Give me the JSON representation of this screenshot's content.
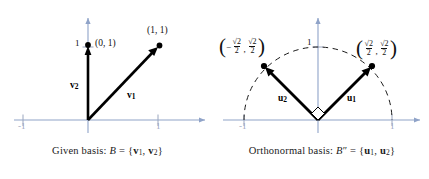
{
  "figure": {
    "type": "vector-diagram",
    "panels": [
      {
        "id": "left",
        "caption_prefix": "Given basis: ",
        "caption_symbol": "B",
        "caption_eq": " = ",
        "caption_set_open": "{",
        "caption_v1": "v",
        "caption_v1_sub": "1",
        "caption_comma": ", ",
        "caption_v2": "v",
        "caption_v2_sub": "2",
        "caption_set_close": "}",
        "point_labels": [
          "(0, 1)",
          "(1, 1)"
        ],
        "vector_labels": [
          {
            "name": "v",
            "sub": "2"
          },
          {
            "name": "v",
            "sub": "1"
          }
        ],
        "axis_ticks": {
          "x_neg": "-1",
          "x_pos": "1",
          "y_pos": "1"
        },
        "vectors": [
          {
            "label": "v1",
            "x": 1,
            "y": 1
          },
          {
            "label": "v2",
            "x": 0,
            "y": 1
          }
        ]
      },
      {
        "id": "right",
        "caption_prefix": "Orthonormal basis: ",
        "caption_symbol": "B",
        "caption_prime": "″",
        "caption_eq": " = ",
        "caption_set_open": "{",
        "caption_u1": "u",
        "caption_u1_sub": "1",
        "caption_comma": ", ",
        "caption_u2": "u",
        "caption_u2_sub": "2",
        "caption_set_close": "}",
        "vector_labels": [
          {
            "name": "u",
            "sub": "2"
          },
          {
            "name": "u",
            "sub": "1"
          }
        ],
        "axis_ticks": {
          "x_neg": "-1",
          "x_pos": "1",
          "y_pos": "1"
        },
        "coordinate_left": {
          "x_sign": "−",
          "x_num": "√2",
          "x_den": "2",
          "y_num": "√2",
          "y_den": "2"
        },
        "coordinate_right": {
          "x_num": "√2",
          "x_den": "2",
          "y_num": "√2",
          "y_den": "2"
        },
        "vectors": [
          {
            "label": "u1",
            "x": 0.7071,
            "y": 0.7071
          },
          {
            "label": "u2",
            "x": -0.7071,
            "y": 0.7071
          }
        ],
        "unit_circle": true,
        "right_angle_marker": true
      }
    ],
    "colors": {
      "axis": "#8fa3c8",
      "vector": "#000000",
      "tick_label": "#9aa6bf",
      "text": "#111111",
      "background": "#ffffff",
      "dashed_arc": "#1a1a1a"
    }
  }
}
